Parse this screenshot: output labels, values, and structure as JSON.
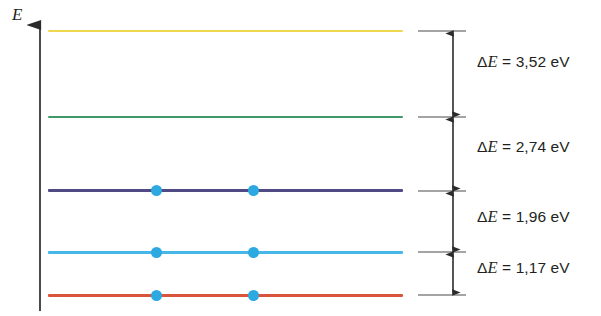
{
  "figure": {
    "type": "energy-level-diagram",
    "axis": {
      "label": "E",
      "name": "energy-axis",
      "direction": "up",
      "x": 40,
      "y_top": 20,
      "y_bottom": 311
    },
    "levels": [
      {
        "id": "level-5",
        "color": "#efd74f",
        "y": 31,
        "thickness": 2.2,
        "electrons": 0
      },
      {
        "id": "level-4",
        "color": "#3f9a68",
        "y": 117,
        "thickness": 2.2,
        "electrons": 0
      },
      {
        "id": "level-3",
        "color": "#4f4a84",
        "y": 191,
        "thickness": 3.0,
        "electrons": 2
      },
      {
        "id": "level-2",
        "color": "#46b7e8",
        "y": 252,
        "thickness": 2.6,
        "electrons": 2
      },
      {
        "id": "level-1",
        "color": "#d9543a",
        "y": 295,
        "thickness": 2.6,
        "electrons": 2
      }
    ],
    "electron_columns_x": [
      156,
      253
    ],
    "electron_color": "#2ca9e1",
    "line_x_start": 48,
    "line_x_end": 403,
    "ticks": [
      {
        "id": "tick-5",
        "y": 31
      },
      {
        "id": "tick-4",
        "y": 117
      },
      {
        "id": "tick-3",
        "y": 191
      },
      {
        "id": "tick-2",
        "y": 252
      },
      {
        "id": "tick-1",
        "y": 295
      }
    ],
    "transitions": [
      {
        "id": "gap-1",
        "delta_prefix": "Δ",
        "var": "E",
        "equals": " = ",
        "value": "3,52",
        "unit": " eV",
        "text": "ΔE = 3,52 eV",
        "y_top": 31,
        "y_bottom": 117,
        "label_y": 62
      },
      {
        "id": "gap-2",
        "delta_prefix": "Δ",
        "var": "E",
        "equals": " = ",
        "value": "2,74",
        "unit": " eV",
        "text": "ΔE = 2,74 eV",
        "y_top": 117,
        "y_bottom": 191,
        "label_y": 147
      },
      {
        "id": "gap-3",
        "delta_prefix": "Δ",
        "var": "E",
        "equals": " = ",
        "value": "1,96",
        "unit": " eV",
        "text": "ΔE = 1,96 eV",
        "y_top": 191,
        "y_bottom": 252,
        "label_y": 216
      },
      {
        "id": "gap-4",
        "delta_prefix": "Δ",
        "var": "E",
        "equals": " = ",
        "value": "1,17",
        "unit": " eV",
        "text": "ΔE = 1,17 eV",
        "y_top": 252,
        "y_bottom": 295,
        "label_y": 267
      }
    ],
    "arrow_x": 453,
    "tick_x_start": 418,
    "tick_x_end": 466,
    "ink_color": "#3a3a3a"
  }
}
